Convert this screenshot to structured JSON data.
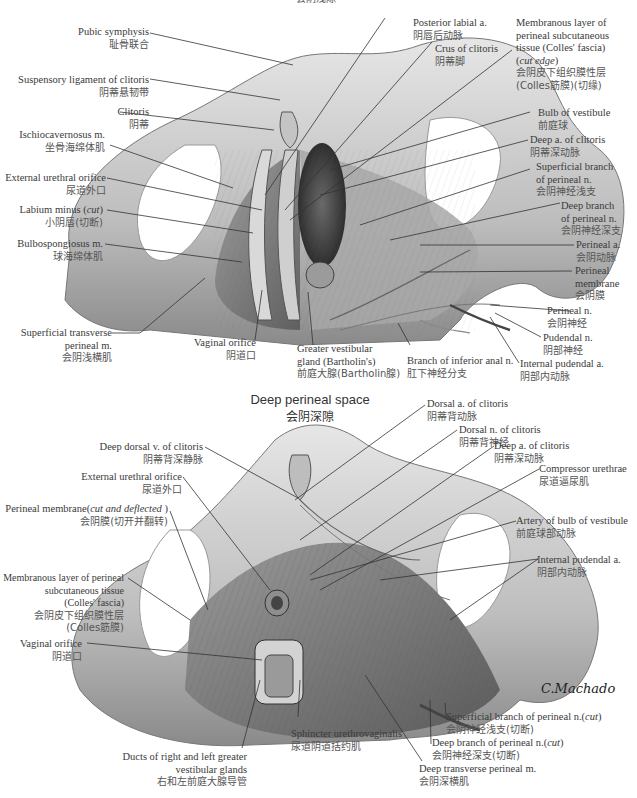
{
  "figure": {
    "top_section": {
      "title_zh_cut": "会阴浅隙",
      "labels": [
        {
          "id": "pubic-symphysis",
          "en": "Pubic symphysis",
          "zh": "耻骨联合"
        },
        {
          "id": "suspensory-ligament",
          "en": "Suspensory ligament of clitoris",
          "zh": "阴蒂悬韧带"
        },
        {
          "id": "clitoris",
          "en": "Clitoris",
          "zh": "阴蒂"
        },
        {
          "id": "ischiocavernosus",
          "en": "Ischiocavernosus m.",
          "zh": "坐骨海绵体肌"
        },
        {
          "id": "external-urethral-orifice",
          "en": "External urethral orifice",
          "zh": "尿道外口"
        },
        {
          "id": "labium-minus",
          "en": "Labium minus (cut)",
          "zh": "小阴唇(切断)"
        },
        {
          "id": "bulbospongiosus",
          "en": "Bulbospongiosus m.",
          "zh": "球海绵体肌"
        },
        {
          "id": "superficial-transverse-perineal",
          "en": "Superficial transverse perineal m.",
          "zh": "会阴浅横肌"
        },
        {
          "id": "vaginal-orifice",
          "en": "Vaginal orifice",
          "zh": "阴道口"
        },
        {
          "id": "greater-vestibular-gland",
          "en": "Greater vestibular gland (Bartholin's)",
          "zh": "前庭大腺(Bartholin腺)"
        },
        {
          "id": "branch-inferior-anal",
          "en": "Branch of inferior anal n.",
          "zh": "肛下神经分支"
        },
        {
          "id": "posterior-labial-a",
          "en": "Posterior labial a.",
          "zh": "阴唇后动脉"
        },
        {
          "id": "crus-of-clitoris",
          "en": "Crus of clitoris",
          "zh": "阴蒂脚"
        },
        {
          "id": "colles-fascia-top",
          "en": "Membranous layer of perineal subcutaneous tissue (Colles' fascia) (cut edge)",
          "zh": "会阴皮下组织膜性层 (Colles筋膜)(切缘)"
        },
        {
          "id": "bulb-of-vestibule",
          "en": "Bulb of vestibule",
          "zh": "前庭球"
        },
        {
          "id": "deep-a-clitoris-top",
          "en": "Deep a. of clitoris",
          "zh": "阴蒂深动脉"
        },
        {
          "id": "superficial-branch-perineal",
          "en": "Superficial branch of perineal n.",
          "zh": "会阴神经浅支"
        },
        {
          "id": "deep-branch-perineal",
          "en": "Deep branch of perineal n.",
          "zh": "会阴神经深支"
        },
        {
          "id": "perineal-a",
          "en": "Perineal a.",
          "zh": "会阴动脉"
        },
        {
          "id": "perineal-membrane",
          "en": "Perineal membrane",
          "zh": "会阴膜"
        },
        {
          "id": "perineal-n",
          "en": "Perineal n.",
          "zh": "会阴神经"
        },
        {
          "id": "pudendal-n",
          "en": "Pudendal n.",
          "zh": "阴部神经"
        },
        {
          "id": "internal-pudendal-a-top",
          "en": "Internal pudendal a.",
          "zh": "阴部内动脉"
        }
      ]
    },
    "bottom_section": {
      "title_en": "Deep perineal space",
      "title_zh": "会阴深隙",
      "labels": [
        {
          "id": "deep-dorsal-v",
          "en": "Deep dorsal v. of clitoris",
          "zh": "阴蒂背深静脉"
        },
        {
          "id": "external-urethral-orifice-b",
          "en": "External urethral orifice",
          "zh": "尿道外口"
        },
        {
          "id": "perineal-membrane-cut",
          "en": "Perineal membrane(cut and deflected )",
          "zh": "会阴膜(切开并翻转)"
        },
        {
          "id": "colles-fascia-bottom",
          "en": "Membranous layer of perineal subcutaneous tissue (Colles' fascia)",
          "zh": "会阴皮下组织膜性层 (Colles筋膜)"
        },
        {
          "id": "vaginal-orifice-b",
          "en": "Vaginal orifice",
          "zh": "阴道口"
        },
        {
          "id": "ducts-greater-vestibular",
          "en": "Ducts of right and left greater vestibular glands",
          "zh": "右和左前庭大腺导管"
        },
        {
          "id": "sphincter-urethrovaginalis",
          "en": "Sphincter urethrovaginalis",
          "zh": "尿道阴道括约肌"
        },
        {
          "id": "deep-transverse-perineal",
          "en": "Deep transverse perineal m.",
          "zh": "会阴深横肌"
        },
        {
          "id": "deep-branch-perineal-cut",
          "en": "Deep branch of perineal n.(cut)",
          "zh": "会阴神经深支(切断)"
        },
        {
          "id": "superficial-branch-perineal-cut",
          "en": "Superficial branch of perineal n.(cut)",
          "zh": "会阴神经浅支(切断)"
        },
        {
          "id": "dorsal-a-clitoris",
          "en": "Dorsal a. of clitoris",
          "zh": "阴蒂背动脉"
        },
        {
          "id": "dorsal-n-clitoris",
          "en": "Dorsal n. of clitoris",
          "zh": "阴蒂背神经"
        },
        {
          "id": "deep-a-clitoris-b",
          "en": "Deep a. of clitoris",
          "zh": "阴蒂深动脉"
        },
        {
          "id": "compressor-urethrae",
          "en": "Compressor urethrae",
          "zh": "尿道逼尿肌"
        },
        {
          "id": "artery-bulb-vestibule",
          "en": "Artery of bulb of vestibule",
          "zh": "前庭球部动脉"
        },
        {
          "id": "internal-pudendal-a-b",
          "en": "Internal pudendal a.",
          "zh": "阴部内动脉"
        }
      ]
    },
    "signature": "C.Machado M.D."
  },
  "text": {
    "t_pubic_en": "Pubic symphysis",
    "t_pubic_zh": "耻骨联合",
    "t_susp_en": "Suspensory ligament of clitoris",
    "t_susp_zh": "阴蒂悬韧带",
    "t_clit_en": "Clitoris",
    "t_clit_zh": "阴蒂",
    "t_ischio_en": "Ischiocavernosus m.",
    "t_ischio_zh": "坐骨海绵体肌",
    "t_eu_en": "External urethral orifice",
    "t_eu_zh": "尿道外口",
    "t_lab_en": "Labium minus (",
    "t_lab_it": "cut",
    "t_lab_end": ")",
    "t_lab_zh": "小阴唇(切断)",
    "t_bulbo_en": "Bulbospongiosus m.",
    "t_bulbo_zh": "球海绵体肌",
    "t_stp_en1": "Superficial transverse",
    "t_stp_en2": "perineal m.",
    "t_stp_zh": "会阴浅横肌",
    "t_vo_en": "Vaginal orifice",
    "t_vo_zh": "阴道口",
    "t_gvg_en1": "Greater vestibular",
    "t_gvg_en2": "gland (Bartholin's)",
    "t_gvg_zh": "前庭大腺(Bartholin腺)",
    "t_bia_en": "Branch of inferior anal n.",
    "t_bia_zh": "肛下神经分支",
    "t_pla_en": "Posterior labial a.",
    "t_pla_zh": "阴唇后动脉",
    "t_crus_en": "Crus of clitoris",
    "t_crus_zh": "阴蒂脚",
    "t_cf_en1": "Membranous layer of",
    "t_cf_en2": "perineal subcutaneous",
    "t_cf_en3": "tissue (Colles' fascia)",
    "t_cf_en4": "cut edge",
    "t_cf_zh1": "会阴皮下组织膜性层",
    "t_cf_zh2": "(Colles筋膜)(切缘)",
    "t_bov_en": "Bulb of vestibule",
    "t_bov_zh": "前庭球",
    "t_dac_en": "Deep a. of clitoris",
    "t_dac_zh": "阴蒂深动脉",
    "t_sbp_en1": "Superficial branch",
    "t_sbp_en2": "of perineal n.",
    "t_sbp_zh": "会阴神经浅支",
    "t_dbp_en1": "Deep branch",
    "t_dbp_en2": "of perineal n.",
    "t_dbp_zh": "会阴神经深支",
    "t_pa_en": "Perineal a.",
    "t_pa_zh": "会阴动脉",
    "t_pm_en1": "Perineal",
    "t_pm_en2": "membrane",
    "t_pm_zh": "会阴膜",
    "t_pn_en": "Perineal n.",
    "t_pn_zh": "会阴神经",
    "t_pud_en": "Pudendal n.",
    "t_pud_zh": "阴部神经",
    "t_ipa_en": "Internal pudendal a.",
    "t_ipa_zh": "阴部内动脉",
    "t_title_en": "Deep perineal space",
    "t_title_zh": "会阴深隙",
    "t_ddv_en": "Deep dorsal v. of clitoris",
    "t_ddv_zh": "阴蒂背深静脉",
    "t_eu2_en": "External urethral orifice",
    "t_eu2_zh": "尿道外口",
    "t_pmc_en": "Perineal membrane(",
    "t_pmc_it": "cut and deflected",
    "t_pmc_end": " )",
    "t_pmc_zh": "会阴膜(切开并翻转)",
    "t_cf2_en1": "Membranous layer of perineal",
    "t_cf2_en2": "subcutaneous tissue",
    "t_cf2_en3": "(Colles' fascia)",
    "t_cf2_zh1": "会阴皮下组织膜性层",
    "t_cf2_zh2": "(Colles筋膜)",
    "t_vo2_en": "Vaginal orifice",
    "t_vo2_zh": "阴道口",
    "t_ducts_en1": "Ducts of right and left greater",
    "t_ducts_en2": "vestibular glands",
    "t_ducts_zh": "右和左前庭大腺导管",
    "t_suv_en": "Sphincter urethrovaginalis",
    "t_suv_zh": "尿道阴道括约肌",
    "t_dtp_en": "Deep transverse perineal m.",
    "t_dtp_zh": "会阴深横肌",
    "t_dbc_en": "Deep branch of perineal n.(",
    "t_dbc_it": "cut",
    "t_dbc_end": ")",
    "t_dbc_zh": "会阴神经深支(切断)",
    "t_sbc_en": "Superficial branch of perineal n.(",
    "t_sbc_it": "cut",
    "t_sbc_end": ")",
    "t_sbc_zh": "会阴神经浅支(切断)",
    "t_dorsa_en": "Dorsal a. of clitoris",
    "t_dorsa_zh": "阴蒂背动脉",
    "t_dorsn_en": "Dorsal n. of clitoris",
    "t_dorsn_zh": "阴蒂背神经",
    "t_dac2_en": "Deep a. of clitoris",
    "t_dac2_zh": "阴蒂深动脉",
    "t_cu_en": "Compressor urethrae",
    "t_cu_zh": "尿道逼尿肌",
    "t_abv_en": "Artery of bulb of vestibule",
    "t_abv_zh": "前庭球部动脉",
    "t_ipa2_en": "Internal pudendal a.",
    "t_ipa2_zh": "阴部内动脉",
    "t_top_cut": "会阴浅隙",
    "t_sig": "C.Machado"
  }
}
